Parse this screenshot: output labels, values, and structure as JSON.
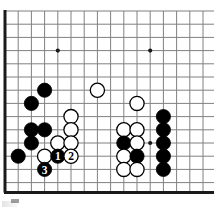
{
  "diagram": {
    "kind": "go-board-diagram",
    "board": {
      "origin_x": 5,
      "origin_y": 11,
      "step": 13.2,
      "cols": 16,
      "rows": 14,
      "edge_left": true,
      "edge_bottom": true,
      "line_color": "#808080",
      "edge_color": "#1a1a1a",
      "line_width": 1,
      "edge_width": 3,
      "background": "#ffffff"
    },
    "star_points": [
      {
        "col": 4,
        "row": 3
      },
      {
        "col": 11,
        "row": 3
      },
      {
        "col": 11,
        "row": 10
      }
    ],
    "stone_radius": 7.1,
    "colors": {
      "black": "#000000",
      "white": "#ffffff",
      "stone_outline": "#000000",
      "label_on_black": "#ffffff",
      "label_on_white": "#000000"
    },
    "stones": [
      {
        "col": 3,
        "row": 6,
        "color": "black",
        "label": ""
      },
      {
        "col": 2,
        "row": 7,
        "color": "black",
        "label": ""
      },
      {
        "col": 7,
        "row": 6,
        "color": "white",
        "label": ""
      },
      {
        "col": 10,
        "row": 7,
        "color": "white",
        "label": ""
      },
      {
        "col": 5,
        "row": 8,
        "color": "white",
        "label": ""
      },
      {
        "col": 12,
        "row": 8,
        "color": "black",
        "label": ""
      },
      {
        "col": 2,
        "row": 9,
        "color": "black",
        "label": ""
      },
      {
        "col": 3,
        "row": 9,
        "color": "black",
        "label": ""
      },
      {
        "col": 5,
        "row": 9,
        "color": "white",
        "label": ""
      },
      {
        "col": 9,
        "row": 9,
        "color": "white",
        "label": ""
      },
      {
        "col": 10,
        "row": 9,
        "color": "white",
        "label": ""
      },
      {
        "col": 12,
        "row": 9,
        "color": "black",
        "label": ""
      },
      {
        "col": 2,
        "row": 10,
        "color": "black",
        "label": ""
      },
      {
        "col": 4,
        "row": 10,
        "color": "white",
        "label": ""
      },
      {
        "col": 5,
        "row": 10,
        "color": "white",
        "label": ""
      },
      {
        "col": 9,
        "row": 10,
        "color": "black",
        "label": ""
      },
      {
        "col": 10,
        "row": 10,
        "color": "white",
        "label": ""
      },
      {
        "col": 12,
        "row": 10,
        "color": "black",
        "label": ""
      },
      {
        "col": 1,
        "row": 11,
        "color": "black",
        "label": ""
      },
      {
        "col": 3,
        "row": 11,
        "color": "white",
        "label": ""
      },
      {
        "col": 4,
        "row": 11,
        "color": "black",
        "label": "1"
      },
      {
        "col": 5,
        "row": 11,
        "color": "white",
        "label": "2"
      },
      {
        "col": 9,
        "row": 11,
        "color": "white",
        "label": ""
      },
      {
        "col": 10,
        "row": 11,
        "color": "black",
        "label": ""
      },
      {
        "col": 12,
        "row": 11,
        "color": "black",
        "label": ""
      },
      {
        "col": 9,
        "row": 12,
        "color": "white",
        "label": ""
      },
      {
        "col": 10,
        "row": 12,
        "color": "white",
        "label": ""
      },
      {
        "col": 12,
        "row": 12,
        "color": "black",
        "label": ""
      },
      {
        "col": 3,
        "row": 12,
        "color": "black",
        "label": "3"
      }
    ],
    "move_sequence": [
      {
        "number": "1",
        "color": "black"
      },
      {
        "number": "2",
        "color": "white"
      },
      {
        "number": "3",
        "color": "black"
      }
    ]
  }
}
